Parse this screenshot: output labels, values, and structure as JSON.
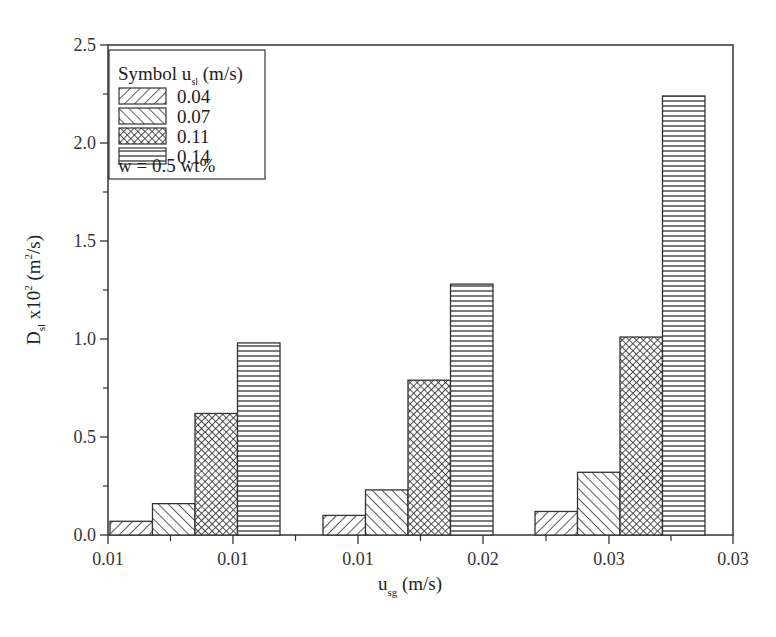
{
  "chart_data": {
    "type": "bar",
    "title": "",
    "xlabel": "u_sg (m/s)",
    "ylabel": "D_sl x10^2 (m^2/s)",
    "ylim": [
      0,
      2.5
    ],
    "yticks": [
      "0.0",
      "0.5",
      "1.0",
      "1.5",
      "2.0",
      "2.5"
    ],
    "xticks": [
      "0.01",
      "0.01",
      "0.01",
      "0.02",
      "0.03",
      "0.03"
    ],
    "grid": false,
    "legend_position": "upper left",
    "legend_title": "Symbol u_sl (m/s)",
    "legend_note": "w  = 0.5 wt%",
    "group_centers_label": "u_sg",
    "categories": [
      "group 1",
      "group 2",
      "group 3"
    ],
    "series": [
      {
        "name": "0.04",
        "pattern": "diagonal-up",
        "values": [
          0.07,
          0.1,
          0.12
        ]
      },
      {
        "name": "0.07",
        "pattern": "diagonal-down",
        "values": [
          0.16,
          0.23,
          0.32
        ]
      },
      {
        "name": "0.11",
        "pattern": "crosshatch",
        "values": [
          0.62,
          0.79,
          1.01
        ]
      },
      {
        "name": "0.14",
        "pattern": "horizontal",
        "values": [
          0.98,
          1.28,
          2.24
        ]
      }
    ]
  },
  "axes": {
    "x_title_main": "u",
    "x_title_sub": "sg",
    "x_title_unit": " (m/s)",
    "y_title_main": "D",
    "y_title_sub": "sl",
    "y_title_mid": " x10",
    "y_title_sup": "2",
    "y_title_unit1": " (m",
    "y_title_sup2": "2",
    "y_title_unit2": "/s)"
  },
  "legend": {
    "title_main": "Symbol u",
    "title_sub": "sl",
    "title_unit": " (m/s)",
    "items": [
      "0.04",
      "0.07",
      "0.11",
      "0.14"
    ],
    "note": "w  = 0.5 wt%"
  }
}
